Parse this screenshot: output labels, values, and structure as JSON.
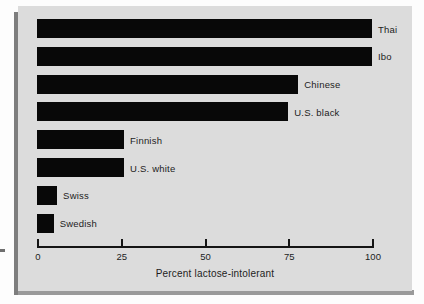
{
  "figure": {
    "background_color": "#dcdcdc",
    "bar_color": "#080808"
  },
  "chart_data": {
    "type": "bar",
    "orientation": "horizontal",
    "title": "",
    "subtitle": "",
    "xlabel": "Percent lactose-intolerant",
    "ylabel": "",
    "xlim": [
      0,
      100
    ],
    "xticks": [
      0,
      25,
      50,
      75,
      100
    ],
    "xtick_labels": [
      "0",
      "25",
      "50",
      "75",
      "100"
    ],
    "grid": false,
    "legend": "none",
    "categories": [
      "Thai",
      "Ibo",
      "Chinese",
      "U.S. black",
      "Finnish",
      "U.S. white",
      "Swiss",
      "Swedish"
    ],
    "values": [
      100,
      100,
      78,
      75,
      26,
      26,
      6,
      5
    ],
    "bars": [
      {
        "label": "Thai",
        "value": 100
      },
      {
        "label": "Ibo",
        "value": 100
      },
      {
        "label": "Chinese",
        "value": 78
      },
      {
        "label": "U.S. black",
        "value": 75
      },
      {
        "label": "Finnish",
        "value": 26
      },
      {
        "label": "U.S. white",
        "value": 26
      },
      {
        "label": "Swiss",
        "value": 6
      },
      {
        "label": "Swedish",
        "value": 5
      }
    ]
  }
}
